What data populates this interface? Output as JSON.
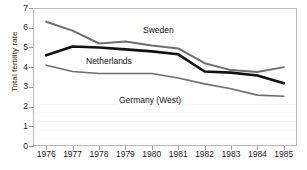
{
  "chart_data": {
    "type": "line",
    "title": "",
    "xlabel": "",
    "ylabel": "Total fertility rate",
    "x": [
      1976,
      1977,
      1978,
      1979,
      1980,
      1981,
      1982,
      1983,
      1984,
      1985
    ],
    "xtick_labels": [
      "1976",
      "1977",
      "1978",
      "1979",
      "1980",
      "1981",
      "1982",
      "1983",
      "1984",
      "1985"
    ],
    "ytick_labels": [
      "0",
      "1",
      "2",
      "3",
      "4",
      "5",
      "6",
      "7"
    ],
    "ylim": [
      0,
      7
    ],
    "ytick_step": 1,
    "grid": false,
    "legend": "inline-labels",
    "series": [
      {
        "name": "Sweden",
        "color": "#6e6e6e",
        "width": 2.0,
        "values": [
          6.3,
          5.85,
          5.2,
          5.3,
          5.1,
          4.95,
          4.2,
          3.85,
          3.75,
          4.0
        ]
      },
      {
        "name": "Netherlands",
        "color": "#111111",
        "width": 2.6,
        "values": [
          4.6,
          5.05,
          5.0,
          4.9,
          4.8,
          4.65,
          3.78,
          3.72,
          3.58,
          3.18
        ]
      },
      {
        "name": "Germany (West)",
        "color": "#6e6e6e",
        "width": 1.6,
        "values": [
          4.1,
          3.78,
          3.68,
          3.68,
          3.68,
          3.45,
          3.15,
          2.9,
          2.58,
          2.52
        ]
      }
    ],
    "annotations": [
      {
        "text": "Sweden",
        "series": "Sweden"
      },
      {
        "text": "Netherlands",
        "series": "Netherlands"
      },
      {
        "text": "Germany (West)",
        "series": "Germany (West)"
      }
    ]
  },
  "axes": {
    "y_title": "Total fertility rate",
    "frame_color": "#b9b9b9",
    "tick_color": "#9a9a9a"
  }
}
